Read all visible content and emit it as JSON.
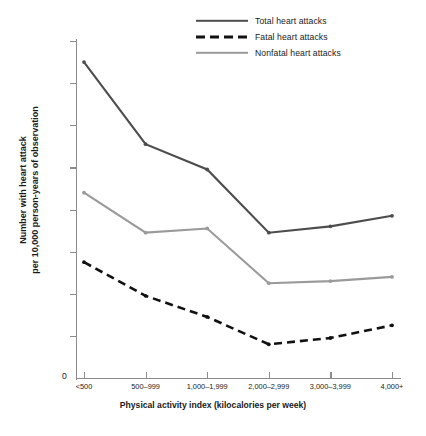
{
  "chart_data": {
    "type": "line",
    "title": "",
    "xlabel": "Physical activity index (kilocalories per week)",
    "ylabel": "Number with heart attack\nper 10,000 person-years of observation",
    "ylabel_line1": "Number with heart attack",
    "ylabel_line2": "per 10,000 person-years of observation",
    "categories": [
      "<500",
      "500–999",
      "1,000–1,999",
      "2,000–2,999",
      "3,000–3,999",
      "4,000+"
    ],
    "ylim": [
      0,
      80
    ],
    "yticks": [
      10,
      20,
      30,
      40,
      50,
      60,
      70,
      80
    ],
    "ytick_labels": [
      "10",
      "20",
      "30",
      "40",
      "50",
      "60",
      "70",
      "80"
    ],
    "yzero_label": "0",
    "grid": false,
    "legend_position": "top-right",
    "series": [
      {
        "name": "Total heart attacks",
        "style": "solid",
        "color": "#4d4d4d",
        "values": [
          75,
          55.5,
          49.5,
          34.5,
          36,
          38.5
        ]
      },
      {
        "name": "Fatal heart attacks",
        "style": "dashed",
        "color": "#111111",
        "values": [
          27.5,
          19.5,
          14.5,
          8,
          9.5,
          12.5
        ]
      },
      {
        "name": "Nonfatal heart attacks",
        "style": "solid",
        "color": "#9a9a9a",
        "values": [
          44,
          34.5,
          35.5,
          22.5,
          23,
          24
        ]
      }
    ]
  }
}
